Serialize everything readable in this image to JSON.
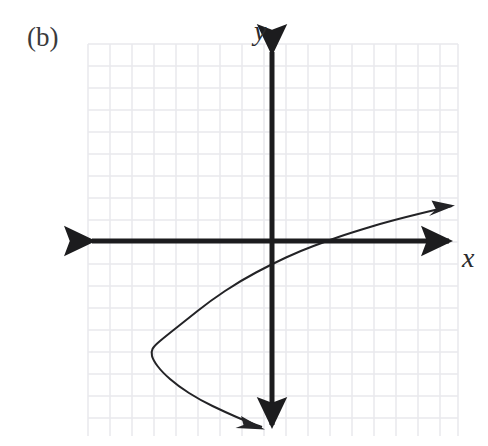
{
  "figure": {
    "panel_label": "(b)",
    "background_color": "#ffffff",
    "width": 488,
    "height": 446
  },
  "axes": {
    "x_label": "x",
    "y_label": "y",
    "axis_color": "#1c1c1e",
    "axis_stroke_width": 5,
    "x_axis": {
      "y_pixel": 241,
      "x_start_pixel": 92,
      "x_end_pixel": 449,
      "arrow_both_ends": true
    },
    "y_axis": {
      "x_pixel": 272,
      "y_start_pixel": 52,
      "y_end_pixel": 425,
      "arrow_both_ends": true
    }
  },
  "grid": {
    "visible": true,
    "color": "#e9e9ec",
    "accent_color": "#ededf0",
    "spacing_px": 22,
    "left_px": 88,
    "top_px": 44,
    "right_px": 458,
    "bottom_px": 436
  },
  "chart_data": {
    "type": "line",
    "title": "",
    "subtitle": "",
    "xlabel": "x",
    "ylabel": "y",
    "grid": true,
    "legend": null,
    "legend_position": "none",
    "curve_color": "#232326",
    "curve_stroke_width": 2,
    "arrow_heads": [
      "upper-right-end",
      "lower-right-end"
    ],
    "xlim": [
      -8.4,
      8.5
    ],
    "ylim": [
      -8.9,
      8.9
    ],
    "unit_px": 22,
    "origin_px": [
      272,
      241
    ],
    "vertex_data": [
      -5.5,
      -4.9
    ],
    "vertex_px": [
      151,
      348
    ],
    "x_intercept_data": [
      2.5,
      0
    ],
    "x_intercept_px": [
      327,
      241
    ],
    "series": [
      {
        "name": "sideways-parabola",
        "points_px": [
          [
            452,
            206
          ],
          [
            400,
            218
          ],
          [
            350,
            233
          ],
          [
            327,
            241
          ],
          [
            300,
            251
          ],
          [
            272,
            264
          ],
          [
            240,
            281
          ],
          [
            210,
            301
          ],
          [
            185,
            321
          ],
          [
            166,
            336
          ],
          [
            154,
            346
          ],
          [
            151,
            352
          ],
          [
            153,
            360
          ],
          [
            162,
            372
          ],
          [
            178,
            386
          ],
          [
            200,
            400
          ],
          [
            225,
            412
          ],
          [
            248,
            422
          ],
          [
            262,
            427
          ]
        ],
        "points_data": [
          [
            8.2,
            1.6
          ],
          [
            5.8,
            1.05
          ],
          [
            3.5,
            0.36
          ],
          [
            2.5,
            0.0
          ],
          [
            1.27,
            -0.45
          ],
          [
            0.0,
            -1.05
          ],
          [
            -1.45,
            -1.82
          ],
          [
            -2.82,
            -2.73
          ],
          [
            -3.95,
            -3.64
          ],
          [
            -4.82,
            -4.32
          ],
          [
            -5.36,
            -4.77
          ],
          [
            -5.5,
            -5.05
          ],
          [
            -5.41,
            -5.41
          ],
          [
            -5.0,
            -5.95
          ],
          [
            -4.27,
            -6.59
          ],
          [
            -3.27,
            -7.23
          ],
          [
            -2.14,
            -7.77
          ],
          [
            -1.09,
            -8.23
          ],
          [
            -0.45,
            -8.45
          ]
        ]
      }
    ]
  }
}
